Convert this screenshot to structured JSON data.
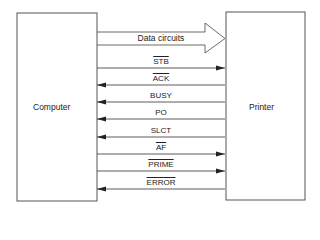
{
  "diagram": {
    "left_box": {
      "label": "Computer"
    },
    "right_box": {
      "label": "Printer"
    },
    "bus": {
      "label": "Data circuits",
      "direction": "computer-to-printer"
    },
    "signals": [
      {
        "label": "STB",
        "overline": true,
        "direction": "right",
        "y": 68
      },
      {
        "label": "ACK",
        "overline": true,
        "direction": "left",
        "y": 85
      },
      {
        "label": "BUSY",
        "overline": false,
        "direction": "left",
        "y": 102
      },
      {
        "label": "PO",
        "overline": false,
        "direction": "left",
        "y": 119
      },
      {
        "label": "SLCT",
        "overline": false,
        "direction": "left",
        "y": 137
      },
      {
        "label": "AF",
        "overline": true,
        "direction": "right",
        "y": 154
      },
      {
        "label": "PRIME",
        "overline": true,
        "direction": "right",
        "y": 171
      },
      {
        "label": "ERROR",
        "overline": true,
        "direction": "left",
        "y": 189
      }
    ],
    "colors": {
      "line": "#333333",
      "box": "#555555"
    }
  }
}
